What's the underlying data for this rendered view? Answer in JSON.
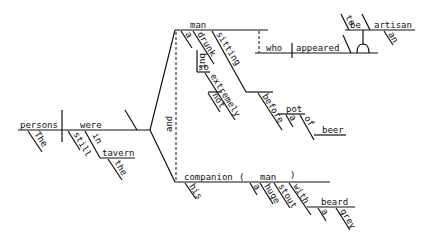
{
  "diagram": {
    "type": "Reed-Kellogg sentence diagram",
    "main_clause": {
      "subject": "persons",
      "subject_modifiers": [
        "The"
      ],
      "verb": "were",
      "verb_modifiers": [
        "still",
        "in"
      ],
      "prep_object": "tavern",
      "prep_object_modifiers": [
        "the"
      ],
      "conjunction": "and"
    },
    "upper_branch": {
      "noun": "man",
      "modifiers": [
        "a",
        "drunk",
        "but",
        "so",
        "extremely",
        "not",
        "sitting",
        "before",
        "pot",
        "a",
        "of",
        "beer"
      ],
      "relative_clause": {
        "subject": "who",
        "verb": "appeared",
        "infinitive": [
          "to",
          "be",
          "artisan",
          "an"
        ]
      }
    },
    "lower_branch": {
      "noun": "companion",
      "paren_open": "(",
      "paren_close": ")",
      "modifiers": [
        "his"
      ],
      "appositive": "man",
      "appositive_modifiers": [
        "a",
        "huge",
        "stout",
        "with",
        "beard",
        "a",
        "grey"
      ]
    }
  }
}
